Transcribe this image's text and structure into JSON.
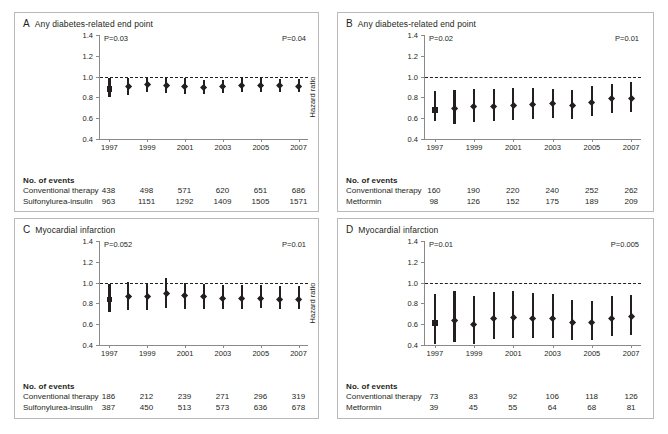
{
  "figure": {
    "axis_title": "Hazard ratio",
    "events_header": "No. of events",
    "y_ticks": [
      "0.4",
      "0.6",
      "0.8",
      "1.0",
      "1.2",
      "1.4"
    ],
    "x_ticks": [
      "1997",
      "1999",
      "2001",
      "2003",
      "2005",
      "2007"
    ]
  },
  "panels": [
    {
      "letter": "A",
      "title": "Any diabetes-related end point",
      "p_left": "P=0.03",
      "p_right": "P=0.04",
      "rows": [
        {
          "label": "Conventional therapy",
          "values": [
            "438",
            "498",
            "571",
            "620",
            "651",
            "686"
          ]
        },
        {
          "label": "Sulfonylurea-insulin",
          "values": [
            "963",
            "1151",
            "1292",
            "1409",
            "1505",
            "1571"
          ]
        }
      ],
      "chart_data": {
        "type": "scatter",
        "title": "Any diabetes-related end point",
        "xlabel": "",
        "ylabel": "Hazard ratio",
        "ylim": [
          0.4,
          1.4
        ],
        "xlim": [
          1997,
          2007
        ],
        "reference_line": 1.0,
        "grid": false,
        "legend": "none",
        "x": [
          1997,
          1998,
          1999,
          2000,
          2001,
          2002,
          2003,
          2004,
          2005,
          2006,
          2007
        ],
        "hazard_ratio": [
          0.88,
          0.9,
          0.92,
          0.91,
          0.9,
          0.89,
          0.9,
          0.91,
          0.91,
          0.91,
          0.9
        ],
        "ci_low": [
          0.8,
          0.82,
          0.85,
          0.84,
          0.83,
          0.83,
          0.84,
          0.85,
          0.85,
          0.85,
          0.85
        ],
        "ci_high": [
          0.99,
          0.99,
          1.0,
          0.99,
          0.99,
          0.97,
          0.97,
          0.99,
          0.99,
          0.98,
          0.98
        ],
        "marker_shapes": [
          "square",
          "diamond",
          "diamond",
          "diamond",
          "diamond",
          "diamond",
          "diamond",
          "diamond",
          "diamond",
          "diamond",
          "diamond"
        ],
        "annotations": [
          "P=0.03",
          "P=0.04"
        ]
      }
    },
    {
      "letter": "B",
      "title": "Any diabetes-related end point",
      "p_left": "P=0.02",
      "p_right": "P=0.01",
      "rows": [
        {
          "label": "Conventional therapy",
          "values": [
            "160",
            "190",
            "220",
            "240",
            "252",
            "262"
          ]
        },
        {
          "label": "Metformin",
          "values": [
            "98",
            "126",
            "152",
            "175",
            "189",
            "209"
          ]
        }
      ],
      "chart_data": {
        "type": "scatter",
        "title": "Any diabetes-related end point",
        "xlabel": "",
        "ylabel": "Hazard ratio",
        "ylim": [
          0.4,
          1.4
        ],
        "xlim": [
          1997,
          2007
        ],
        "reference_line": 1.0,
        "grid": false,
        "legend": "none",
        "x": [
          1997,
          1998,
          1999,
          2000,
          2001,
          2002,
          2003,
          2004,
          2005,
          2006,
          2007
        ],
        "hazard_ratio": [
          0.68,
          0.69,
          0.71,
          0.71,
          0.72,
          0.73,
          0.74,
          0.72,
          0.75,
          0.79,
          0.79
        ],
        "ci_low": [
          0.57,
          0.54,
          0.56,
          0.57,
          0.58,
          0.59,
          0.6,
          0.59,
          0.62,
          0.65,
          0.66
        ],
        "ci_high": [
          0.86,
          0.87,
          0.88,
          0.88,
          0.89,
          0.89,
          0.88,
          0.87,
          0.91,
          0.93,
          0.95
        ],
        "marker_shapes": [
          "square",
          "diamond",
          "diamond",
          "diamond",
          "diamond",
          "diamond",
          "diamond",
          "diamond",
          "diamond",
          "diamond",
          "diamond"
        ],
        "annotations": [
          "P=0.02",
          "P=0.01"
        ]
      }
    },
    {
      "letter": "C",
      "title": "Myocardial infarction",
      "p_left": "P=0.052",
      "p_right": "P=0.01",
      "rows": [
        {
          "label": "Conventional therapy",
          "values": [
            "186",
            "212",
            "239",
            "271",
            "296",
            "319"
          ]
        },
        {
          "label": "Sulfonylurea-insulin",
          "values": [
            "387",
            "450",
            "513",
            "573",
            "636",
            "678"
          ]
        }
      ],
      "chart_data": {
        "type": "scatter",
        "title": "Myocardial infarction",
        "xlabel": "",
        "ylabel": "Hazard ratio",
        "ylim": [
          0.4,
          1.4
        ],
        "xlim": [
          1997,
          2007
        ],
        "reference_line": 1.0,
        "grid": false,
        "legend": "none",
        "x": [
          1997,
          1998,
          1999,
          2000,
          2001,
          2002,
          2003,
          2004,
          2005,
          2006,
          2007
        ],
        "hazard_ratio": [
          0.84,
          0.86,
          0.86,
          0.89,
          0.87,
          0.86,
          0.85,
          0.85,
          0.85,
          0.84,
          0.84
        ],
        "ci_low": [
          0.72,
          0.74,
          0.74,
          0.76,
          0.75,
          0.75,
          0.75,
          0.75,
          0.76,
          0.75,
          0.75
        ],
        "ci_high": [
          0.99,
          1.01,
          1.0,
          1.04,
          1.0,
          0.99,
          0.98,
          0.98,
          0.98,
          0.97,
          0.97
        ],
        "marker_shapes": [
          "square",
          "diamond",
          "diamond",
          "diamond",
          "diamond",
          "diamond",
          "diamond",
          "diamond",
          "diamond",
          "diamond",
          "diamond"
        ],
        "annotations": [
          "P=0.052",
          "P=0.01"
        ]
      }
    },
    {
      "letter": "D",
      "title": "Myocardial infarction",
      "p_left": "P=0.01",
      "p_right": "P=0.005",
      "rows": [
        {
          "label": "Conventional therapy",
          "values": [
            "73",
            "83",
            "92",
            "106",
            "118",
            "126"
          ]
        },
        {
          "label": "Metformin",
          "values": [
            "39",
            "45",
            "55",
            "64",
            "68",
            "81"
          ]
        }
      ],
      "chart_data": {
        "type": "scatter",
        "title": "Myocardial infarction",
        "xlabel": "",
        "ylabel": "Hazard ratio",
        "ylim": [
          0.4,
          1.4
        ],
        "xlim": [
          1997,
          2007
        ],
        "reference_line": 1.0,
        "grid": false,
        "legend": "none",
        "x": [
          1997,
          1998,
          1999,
          2000,
          2001,
          2002,
          2003,
          2004,
          2005,
          2006,
          2007
        ],
        "hazard_ratio": [
          0.61,
          0.63,
          0.6,
          0.65,
          0.66,
          0.65,
          0.65,
          0.61,
          0.61,
          0.65,
          0.67
        ],
        "ci_low": [
          0.41,
          0.43,
          0.41,
          0.46,
          0.47,
          0.47,
          0.47,
          0.45,
          0.45,
          0.49,
          0.5
        ],
        "ci_high": [
          0.89,
          0.92,
          0.87,
          0.91,
          0.92,
          0.9,
          0.89,
          0.83,
          0.82,
          0.87,
          0.88
        ],
        "marker_shapes": [
          "square",
          "diamond",
          "diamond",
          "diamond",
          "diamond",
          "diamond",
          "diamond",
          "diamond",
          "diamond",
          "diamond",
          "diamond"
        ],
        "annotations": [
          "P=0.01",
          "P=0.005"
        ]
      }
    }
  ]
}
